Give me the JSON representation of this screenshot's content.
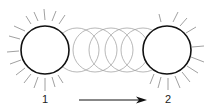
{
  "diagram": {
    "title": "",
    "start": {
      "label": "1",
      "cx": 45,
      "cy": 50,
      "r": 24
    },
    "end": {
      "label": "2",
      "cx": 167,
      "cy": 50,
      "r": 24
    },
    "ghosts": [
      {
        "cx": 77,
        "cy": 50,
        "r": 22
      },
      {
        "cx": 95,
        "cy": 50,
        "r": 22
      },
      {
        "cx": 111,
        "cy": 50,
        "r": 22
      },
      {
        "cx": 127,
        "cy": 50,
        "r": 22
      },
      {
        "cx": 143,
        "cy": 50,
        "r": 22
      }
    ],
    "arrow": {
      "x1": 79,
      "x2": 147,
      "y": 100,
      "direction": "right"
    },
    "colors": {
      "stroke": "#111111",
      "ghost": "#999999",
      "rays": "#888888"
    }
  }
}
